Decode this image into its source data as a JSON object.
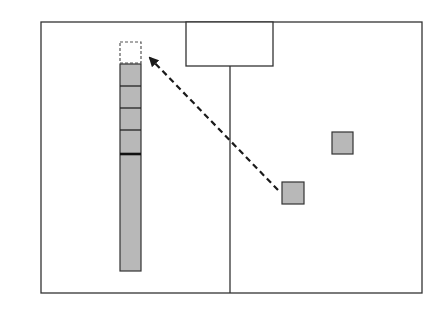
{
  "diagram": {
    "colors": {
      "background": "#ffffff",
      "stroke": "#333333",
      "block_fill": "#b8b8b8",
      "arrow": "#1a1a1a"
    },
    "frame": {
      "x": 41,
      "y": 22,
      "w": 381,
      "h": 271
    },
    "top_box": {
      "x": 186,
      "y": 22,
      "w": 87,
      "h": 44
    },
    "divider": {
      "x": 230,
      "y1": 66,
      "y2": 293
    },
    "column": {
      "x": 120,
      "w": 21,
      "target_slot": {
        "y": 42,
        "h": 21,
        "style": "dashed"
      },
      "segments": [
        {
          "y": 64,
          "h": 22
        },
        {
          "y": 86,
          "h": 22
        },
        {
          "y": 108,
          "h": 22
        },
        {
          "y": 130,
          "h": 23
        },
        {
          "y": 153,
          "h": 118
        }
      ]
    },
    "blocks": [
      {
        "x": 282,
        "y": 182,
        "w": 22,
        "h": 22
      },
      {
        "x": 332,
        "y": 132,
        "w": 21,
        "h": 22
      }
    ],
    "arrow": {
      "x1": 278,
      "y1": 190,
      "x2": 150,
      "y2": 58,
      "style": "dashed"
    }
  }
}
